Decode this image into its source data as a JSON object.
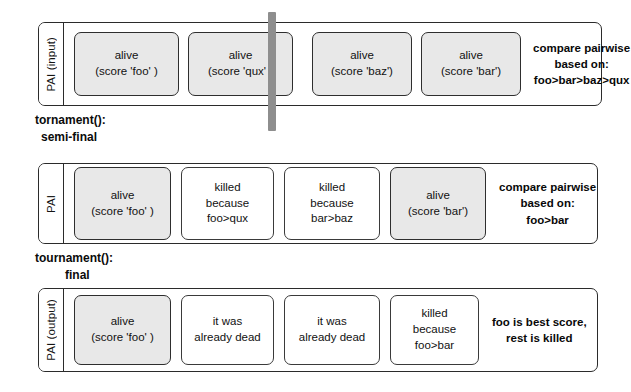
{
  "diagram": {
    "colors": {
      "alive_card_fill": "#e8e8e8",
      "dead_card_fill": "#ffffff",
      "border": "#2b2b2b",
      "split_bar": "#8e8e8e",
      "background": "#ffffff"
    }
  },
  "rows": [
    {
      "id": "pai-input",
      "label": "PAI (input)",
      "cards": [
        {
          "state": "alive",
          "line1": "alive",
          "line2": "(score 'foo' )"
        },
        {
          "state": "alive",
          "line1": "alive",
          "line2": "(score 'qux' )"
        },
        {
          "state": "alive",
          "line1": "alive",
          "line2": "(score 'baz')"
        },
        {
          "state": "alive",
          "line1": "alive",
          "line2": "(score 'bar')"
        }
      ],
      "note": {
        "line1": "compare pairwise",
        "line2": "based on:",
        "line3": "foo>bar>baz>qux"
      }
    },
    {
      "id": "pai-semifinal",
      "label": "PAI",
      "cards": [
        {
          "state": "alive",
          "line1": "alive",
          "line2": "(score 'foo' )",
          "line3": ""
        },
        {
          "state": "killed",
          "line1": "killed",
          "line2": "because",
          "line3": "foo>qux"
        },
        {
          "state": "killed",
          "line1": "killed",
          "line2": "because",
          "line3": "bar>baz"
        },
        {
          "state": "alive",
          "line1": "alive",
          "line2": "(score 'bar')",
          "line3": ""
        }
      ],
      "note": {
        "line1": "compare pairwise",
        "line2": "based on:",
        "line3": "foo>bar"
      }
    },
    {
      "id": "pai-output",
      "label": "PAI (output)",
      "cards": [
        {
          "state": "alive",
          "line1": "alive",
          "line2": "(score 'foo' )",
          "line3": ""
        },
        {
          "state": "killed",
          "line1": "it was",
          "line2": "already dead",
          "line3": ""
        },
        {
          "state": "killed",
          "line1": "it was",
          "line2": "already dead",
          "line3": ""
        },
        {
          "state": "killed",
          "line1": "killed",
          "line2": "because",
          "line3": "foo>bar"
        }
      ],
      "note": {
        "line1": "foo is best score,",
        "line2": "rest is killed",
        "line3": ""
      }
    }
  ],
  "captions": [
    {
      "id": "semi-final",
      "line1": "tornament():",
      "line2": "semi-final"
    },
    {
      "id": "final",
      "line1": "tournament():",
      "line2": "final"
    }
  ]
}
